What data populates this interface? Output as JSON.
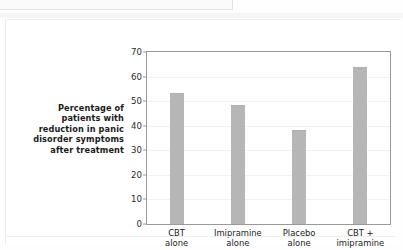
{
  "figure": {
    "axis_title_lines": [
      "Percentage of",
      "patients with",
      "reduction in panic",
      "disorder symptoms",
      "after treatment"
    ],
    "colors": {
      "bar_fill": "#b6b6b6",
      "frame": "#9a9a9a",
      "gridline": "#f2f2f2",
      "background": "#ffffff",
      "text": "#1b1b1b"
    }
  },
  "chart_data": {
    "type": "bar",
    "title": "",
    "xlabel": "",
    "ylabel": "Percentage of patients with reduction in panic disorder symptoms after treatment",
    "categories": [
      "CBT alone",
      "Imipramine alone",
      "Placebo alone",
      "CBT + imipramine"
    ],
    "category_lines": [
      [
        "CBT",
        "alone"
      ],
      [
        "Imipramine",
        "alone"
      ],
      [
        "Placebo",
        "alone"
      ],
      [
        "CBT +",
        "imipramine"
      ]
    ],
    "values": [
      53,
      48,
      38,
      63.5
    ],
    "ylim": [
      0,
      70
    ],
    "yticks": [
      0,
      10,
      20,
      30,
      40,
      50,
      60,
      70
    ],
    "ytick_labels": [
      "0",
      "10",
      "20",
      "30",
      "40",
      "50",
      "60",
      "70"
    ],
    "grid": true,
    "legend": "none"
  }
}
